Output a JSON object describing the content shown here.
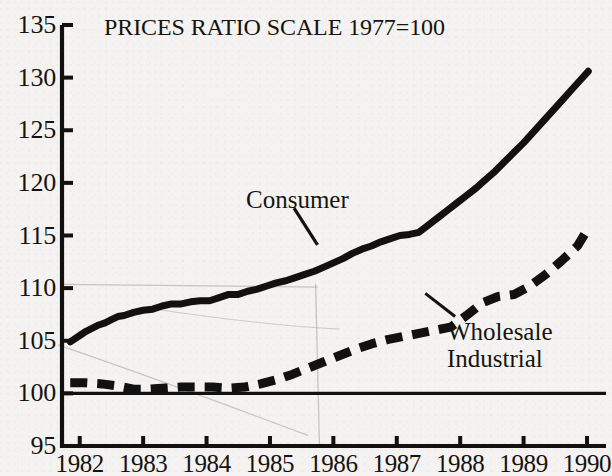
{
  "chart_data": {
    "type": "line",
    "title": "PRICES RATIO SCALE 1977=100",
    "xlabel": "",
    "ylabel": "",
    "xlim": [
      1981.72,
      1990.3
    ],
    "ylim": [
      95,
      135
    ],
    "grid": false,
    "legend_position": "inline-annotation",
    "baseline": 100,
    "y_ticks": [
      135,
      130,
      125,
      120,
      115,
      110,
      105,
      100,
      95
    ],
    "x_ticks": [
      1982,
      1983,
      1984,
      1985,
      1986,
      1987,
      1988,
      1989,
      1990
    ],
    "y_tick_labels": [
      "135",
      "130",
      "125",
      "120",
      "115",
      "110",
      "105",
      "100",
      "95"
    ],
    "x_tick_labels": [
      "1982",
      "1983",
      "1984",
      "1985",
      "1986",
      "1987",
      "1988",
      "1989",
      "1990"
    ],
    "annotations": [
      {
        "text": "Consumer",
        "x": 1985.0,
        "y": 118.6
      },
      {
        "text": "Wholesale",
        "x": 1988.0,
        "y": 106.4
      },
      {
        "text": "Industrial",
        "x": 1988.0,
        "y": 104.4
      }
    ],
    "series": [
      {
        "name": "Consumer",
        "style": "solid",
        "color": "#111111",
        "width": 7,
        "x": [
          1981.85,
          1982.0,
          1982.1,
          1982.2,
          1982.3,
          1982.4,
          1982.5,
          1982.6,
          1982.7,
          1982.85,
          1983.0,
          1983.15,
          1983.3,
          1983.45,
          1983.6,
          1983.75,
          1983.9,
          1984.05,
          1984.2,
          1984.35,
          1984.5,
          1984.65,
          1984.8,
          1984.95,
          1985.1,
          1985.25,
          1985.4,
          1985.55,
          1985.7,
          1985.85,
          1986.0,
          1986.15,
          1986.3,
          1986.45,
          1986.6,
          1986.75,
          1986.9,
          1987.05,
          1987.2,
          1987.35,
          1987.5,
          1987.65,
          1987.8,
          1987.95,
          1988.1,
          1988.25,
          1988.4,
          1988.55,
          1988.7,
          1988.85,
          1989.0,
          1989.15,
          1989.3,
          1989.45,
          1989.6,
          1989.75,
          1989.9,
          1990.02
        ],
        "y": [
          104.9,
          105.5,
          105.9,
          106.2,
          106.5,
          106.7,
          107.0,
          107.3,
          107.4,
          107.7,
          107.9,
          108.0,
          108.3,
          108.5,
          108.5,
          108.7,
          108.8,
          108.8,
          109.1,
          109.4,
          109.4,
          109.7,
          109.9,
          110.2,
          110.5,
          110.7,
          111.0,
          111.3,
          111.6,
          112.0,
          112.4,
          112.8,
          113.3,
          113.7,
          114.0,
          114.4,
          114.7,
          115.0,
          115.1,
          115.3,
          116.0,
          116.7,
          117.4,
          118.1,
          118.8,
          119.5,
          120.3,
          121.1,
          122.0,
          122.9,
          123.8,
          124.8,
          125.8,
          126.8,
          127.8,
          128.8,
          129.8,
          130.6
        ]
      },
      {
        "name": "Wholesale Industrial",
        "style": "dashed",
        "color": "#111111",
        "width": 9,
        "dash": "17 10",
        "x": [
          1981.85,
          1982.1,
          1982.35,
          1982.6,
          1982.85,
          1983.1,
          1983.35,
          1983.6,
          1983.85,
          1984.1,
          1984.35,
          1984.6,
          1984.85,
          1985.1,
          1985.35,
          1985.6,
          1985.85,
          1986.1,
          1986.35,
          1986.6,
          1986.85,
          1987.1,
          1987.35,
          1987.6,
          1987.85,
          1988.1,
          1988.35,
          1988.6,
          1988.85,
          1989.1,
          1989.35,
          1989.6,
          1989.85,
          1990.0
        ],
        "y": [
          101.0,
          101.0,
          100.9,
          100.7,
          100.4,
          100.4,
          100.5,
          100.6,
          100.6,
          100.6,
          100.5,
          100.6,
          100.9,
          101.3,
          101.8,
          102.4,
          103.0,
          103.6,
          104.2,
          104.7,
          105.1,
          105.4,
          105.7,
          106.0,
          106.3,
          107.4,
          108.6,
          109.2,
          109.4,
          110.2,
          111.3,
          112.6,
          114.0,
          115.5
        ]
      }
    ],
    "ghost_artifacts": [
      {
        "kind": "horizontal",
        "note": "faint scan bleed-through near 110.3"
      },
      {
        "kind": "arc",
        "note": "faint curved bleed-through lower-left"
      },
      {
        "kind": "vertical",
        "note": "faint vertical bleed-through near 1985.7"
      }
    ]
  },
  "colors": {
    "ink": "#111111",
    "paper": "#f4f3f1",
    "ghost": "#a9a6a2"
  }
}
